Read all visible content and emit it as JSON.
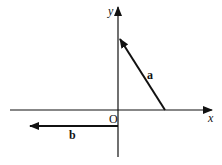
{
  "diagram": {
    "type": "vector-diagram",
    "axes": {
      "x_label": "x",
      "y_label": "y",
      "origin_label": "O"
    },
    "vectors": [
      {
        "name": "a",
        "label": "a",
        "description": "vector from a point on the positive x-axis to a point on the positive y-axis"
      },
      {
        "name": "b",
        "label": "b",
        "description": "horizontal vector pointing left, below the x-axis, starting at the y-axis"
      }
    ],
    "colors": {
      "ink": "#111111",
      "background": "#ffffff"
    }
  }
}
